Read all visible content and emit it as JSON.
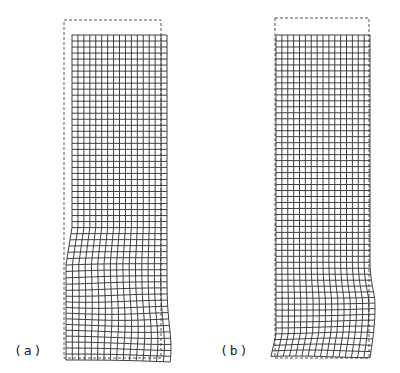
{
  "figure": {
    "panels": [
      {
        "id": "a",
        "label": "(a)",
        "label_pos": [
          14,
          343
        ],
        "dashed_outline": {
          "x": 64,
          "y": 20,
          "w": 97,
          "h": 338
        },
        "mesh": {
          "x": 72,
          "y": 35,
          "w": 95,
          "h": 325,
          "cols": 16,
          "rows": 54,
          "deformation": "left-lower bulge",
          "kink_row": 38,
          "kink_side": "left"
        }
      },
      {
        "id": "b",
        "label": "(b)",
        "label_pos": [
          220,
          343
        ],
        "dashed_outline": {
          "x": 275,
          "y": 18,
          "w": 94,
          "h": 340
        },
        "mesh": {
          "x": 276,
          "y": 35,
          "w": 94,
          "h": 323,
          "cols": 16,
          "rows": 54,
          "deformation": "right-lower bulge",
          "kink_row": 44,
          "kink_side": "right"
        }
      }
    ],
    "colors": {
      "line": "#2a2a2a",
      "dash": "#555555",
      "background": "#ffffff"
    }
  }
}
